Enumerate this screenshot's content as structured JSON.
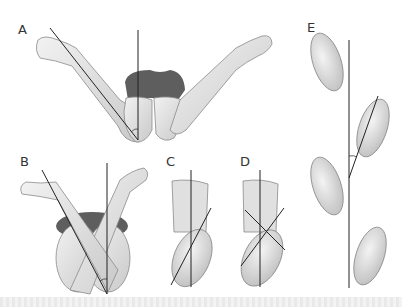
{
  "figure": {
    "panels": [
      {
        "id": "A",
        "label": "A",
        "content": "Prone legs with knees flexed, feet rotated outward; thigh-foot angle measured between vertical axis and leg"
      },
      {
        "id": "B",
        "label": "B",
        "content": "Prone legs crossed, feet rotated inward; angle between vertical axis and leg"
      },
      {
        "id": "C",
        "label": "C",
        "content": "Foot viewed from below with single axis line crossing vertical reference"
      },
      {
        "id": "D",
        "label": "D",
        "content": "Foot viewed from below with two crossing axis lines"
      },
      {
        "id": "E",
        "label": "E",
        "content": "Footprint progression with foot progression angle relative to line of walking"
      }
    ],
    "colors": {
      "skin": "#e8e8e8",
      "skin_shadow": "#bdbdbd",
      "outline": "#8a8a8a",
      "garment": "#5a5a5a",
      "line": "#222222"
    }
  }
}
